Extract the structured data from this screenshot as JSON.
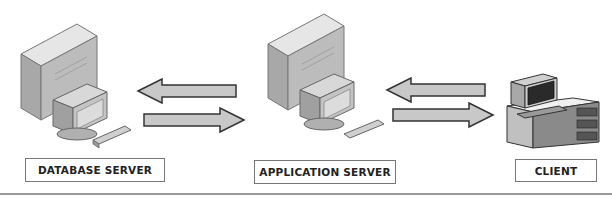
{
  "diagram": {
    "type": "three-tier client-server architecture",
    "nodes": [
      {
        "id": "database-server",
        "label": "DATABASE SERVER",
        "icon": "server-tower-with-monitor-icon"
      },
      {
        "id": "application-server",
        "label": "APPLICATION SERVER",
        "icon": "server-tower-with-monitor-icon"
      },
      {
        "id": "client",
        "label": "CLIENT",
        "icon": "workstation-terminal-icon"
      }
    ],
    "edges": [
      {
        "from": "application-server",
        "to": "database-server",
        "direction": "left"
      },
      {
        "from": "database-server",
        "to": "application-server",
        "direction": "right"
      },
      {
        "from": "client",
        "to": "application-server",
        "direction": "left"
      },
      {
        "from": "application-server",
        "to": "client",
        "direction": "right"
      }
    ],
    "colors": {
      "arrow_fill": "#c8c8c8",
      "arrow_stroke": "#333333",
      "tower_top": "#e6e6e6",
      "tower_front": "#b4b4b4",
      "tower_side": "#9a9a9a",
      "label_border": "#777777",
      "divider": "#9a9a9a"
    }
  }
}
